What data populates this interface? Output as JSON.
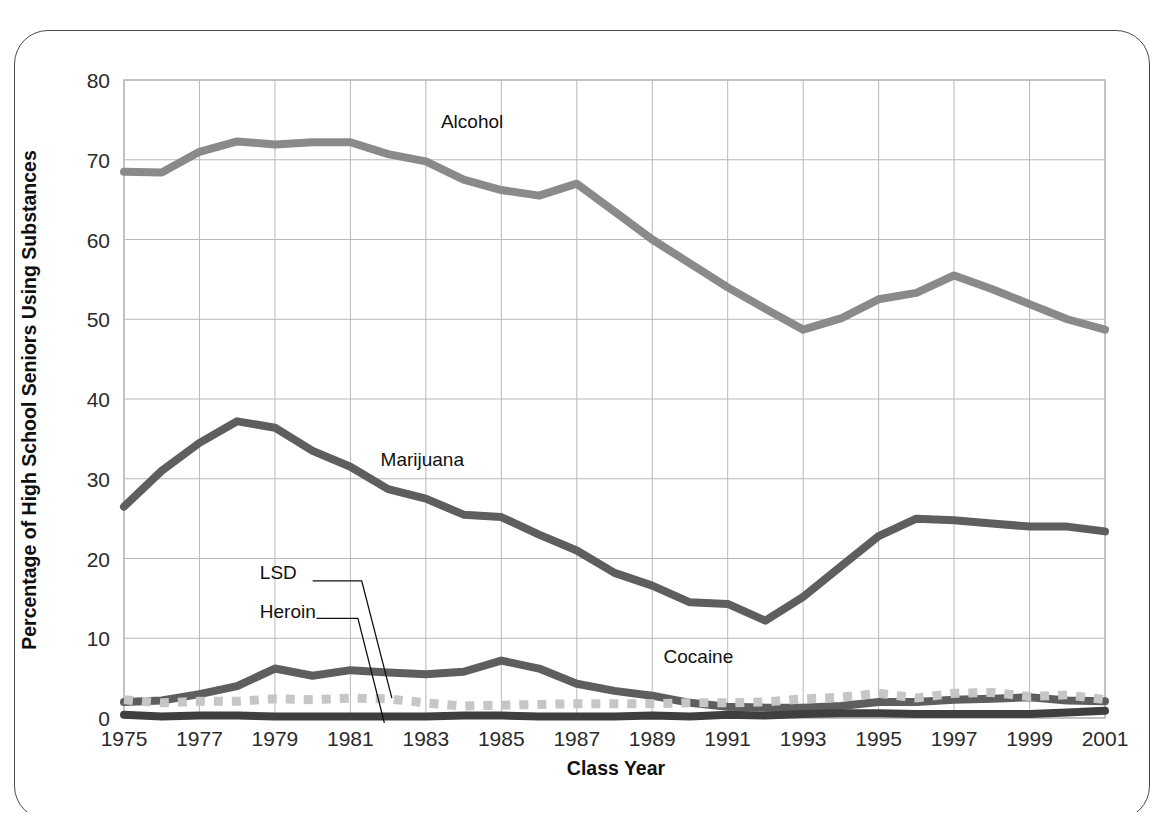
{
  "chart_data": {
    "type": "line",
    "title": "",
    "xlabel": "Class Year",
    "ylabel": "Percentage of High School Seniors Using Substances",
    "xlim": [
      1975,
      2001
    ],
    "ylim": [
      0,
      80
    ],
    "yticks": [
      0,
      10,
      20,
      30,
      40,
      50,
      60,
      70,
      80
    ],
    "xticks": [
      1975,
      1977,
      1979,
      1981,
      1983,
      1985,
      1987,
      1989,
      1991,
      1993,
      1995,
      1997,
      1999,
      2001
    ],
    "grid": true,
    "legend": "inline-annotations",
    "x": [
      1975,
      1976,
      1977,
      1978,
      1979,
      1980,
      1981,
      1982,
      1983,
      1984,
      1985,
      1986,
      1987,
      1988,
      1989,
      1990,
      1991,
      1992,
      1993,
      1994,
      1995,
      1996,
      1997,
      1998,
      1999,
      2000,
      2001
    ],
    "series": [
      {
        "name": "Alcohol",
        "color": "#8a8a8a",
        "style": "solid",
        "label_x": 1983.4,
        "label_y": 74.0,
        "values": [
          68.5,
          68.4,
          71.0,
          72.3,
          71.9,
          72.2,
          72.2,
          70.7,
          69.8,
          67.5,
          66.2,
          65.5,
          67.0,
          63.5,
          60.0,
          57.0,
          54.0,
          51.3,
          48.7,
          50.1,
          52.5,
          53.3,
          55.5,
          53.8,
          51.9,
          50.0,
          48.7
        ]
      },
      {
        "name": "Marijuana",
        "color": "#5e5e5e",
        "style": "solid",
        "label_x": 1981.8,
        "label_y": 31.6,
        "values": [
          26.5,
          31.0,
          34.5,
          37.2,
          36.4,
          33.5,
          31.5,
          28.7,
          27.5,
          25.5,
          25.2,
          23.0,
          21.0,
          18.2,
          16.6,
          14.5,
          14.3,
          12.2,
          15.2,
          19.0,
          22.8,
          25.0,
          24.8,
          24.4,
          24.0,
          24.0,
          23.4
        ]
      },
      {
        "name": "Cocaine",
        "color": "#5e5e5e",
        "style": "solid",
        "label_x": 1989.3,
        "label_y": 6.9,
        "values": [
          2.0,
          2.2,
          3.0,
          4.0,
          6.2,
          5.3,
          6.0,
          5.7,
          5.5,
          5.8,
          7.2,
          6.2,
          4.3,
          3.4,
          2.8,
          1.9,
          1.4,
          1.3,
          1.3,
          1.5,
          2.0,
          2.0,
          2.3,
          2.4,
          2.6,
          2.2,
          2.1
        ]
      },
      {
        "name": "LSD",
        "color": "#c6c6c6",
        "style": "dashed",
        "label_x": 1978.6,
        "label_y": 17.4,
        "values": [
          2.3,
          1.9,
          2.1,
          2.1,
          2.4,
          2.3,
          2.5,
          2.4,
          1.9,
          1.5,
          1.6,
          1.7,
          1.8,
          1.8,
          1.8,
          1.9,
          1.9,
          2.0,
          2.4,
          2.6,
          3.1,
          2.5,
          3.1,
          3.2,
          2.7,
          2.9,
          2.3
        ]
      },
      {
        "name": "Heroin",
        "color": "#3f3f3f",
        "style": "solid",
        "label_x": 1978.6,
        "label_y": 12.6,
        "values": [
          0.4,
          0.2,
          0.3,
          0.3,
          0.2,
          0.2,
          0.2,
          0.2,
          0.2,
          0.3,
          0.3,
          0.2,
          0.2,
          0.2,
          0.3,
          0.2,
          0.4,
          0.3,
          0.5,
          0.6,
          0.6,
          0.5,
          0.5,
          0.5,
          0.5,
          0.7,
          0.9
        ]
      }
    ]
  },
  "axes": {
    "x_title": "Class Year",
    "y_title": "Percentage of High School Seniors Using Substances",
    "y_tick_labels": [
      "80",
      "70",
      "60",
      "50",
      "40",
      "30",
      "20",
      "10",
      "0"
    ],
    "x_tick_labels": [
      "1975",
      "1977",
      "1979",
      "1981",
      "1983",
      "1985",
      "1987",
      "1989",
      "1991",
      "1993",
      "1995",
      "1997",
      "1999",
      "2001"
    ]
  },
  "annotations": {
    "alcohol": "Alcohol",
    "marijuana": "Marijuana",
    "cocaine": "Cocaine",
    "lsd": "LSD",
    "heroin": "Heroin"
  },
  "colors": {
    "alcohol": "#8a8a8a",
    "marijuana": "#5e5e5e",
    "cocaine": "#5e5e5e",
    "lsd": "#c6c6c6",
    "heroin": "#3f3f3f",
    "grid": "#b8b8b8",
    "frame": "#4a4a4a",
    "text": "#2b2b2b"
  }
}
